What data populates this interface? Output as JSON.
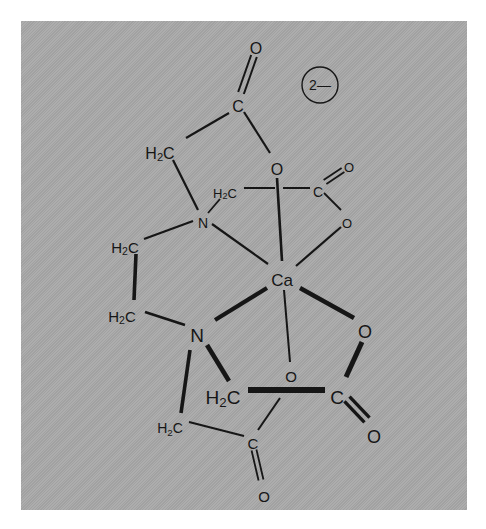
{
  "diagram": {
    "charge_badge": {
      "label": "2—",
      "cx": 320,
      "cy": 85,
      "r": 18
    },
    "colors": {
      "panel": "#a8a8a8",
      "ink": "#161616",
      "page": "#ffffff"
    },
    "atoms": [
      {
        "id": "o_top",
        "label": "O",
        "x": 256,
        "y": 48,
        "size": 16
      },
      {
        "id": "c_top",
        "label": "C",
        "x": 238,
        "y": 106,
        "size": 16
      },
      {
        "id": "ch2_a",
        "label": "H₂C",
        "x": 160,
        "y": 153,
        "size": 16
      },
      {
        "id": "o_a",
        "label": "O",
        "x": 277,
        "y": 169,
        "size": 16
      },
      {
        "id": "ch2_b",
        "label": "H₂C",
        "x": 225,
        "y": 193,
        "size": 13
      },
      {
        "id": "c_b",
        "label": "C",
        "x": 318,
        "y": 192,
        "size": 14
      },
      {
        "id": "o_b_dbl",
        "label": "O",
        "x": 349,
        "y": 167,
        "size": 13
      },
      {
        "id": "o_b",
        "label": "O",
        "x": 347,
        "y": 223,
        "size": 13
      },
      {
        "id": "n_top",
        "label": "N",
        "x": 203,
        "y": 223,
        "size": 14
      },
      {
        "id": "ch2_c",
        "label": "H₂C",
        "x": 125,
        "y": 247,
        "size": 15
      },
      {
        "id": "ca",
        "label": "Ca",
        "x": 282,
        "y": 280,
        "size": 17
      },
      {
        "id": "ch2_d",
        "label": "H₂C",
        "x": 122,
        "y": 316,
        "size": 15
      },
      {
        "id": "n_bot",
        "label": "N",
        "x": 197,
        "y": 335,
        "size": 19
      },
      {
        "id": "o_c",
        "label": "O",
        "x": 365,
        "y": 332,
        "size": 18
      },
      {
        "id": "o_d",
        "label": "O",
        "x": 291,
        "y": 376,
        "size": 15
      },
      {
        "id": "ch2_e",
        "label": "H₂C",
        "x": 223,
        "y": 397,
        "size": 19
      },
      {
        "id": "c_e",
        "label": "C",
        "x": 337,
        "y": 397,
        "size": 19
      },
      {
        "id": "ch2_f",
        "label": "H₂C",
        "x": 170,
        "y": 428,
        "size": 14
      },
      {
        "id": "o_e_dbl",
        "label": "O",
        "x": 374,
        "y": 437,
        "size": 18
      },
      {
        "id": "c_f",
        "label": "C",
        "x": 253,
        "y": 443,
        "size": 15
      },
      {
        "id": "o_f",
        "label": "O",
        "x": 264,
        "y": 496,
        "size": 15
      }
    ],
    "bonds": [
      {
        "x1": 186,
        "y1": 138,
        "x2": 229,
        "y2": 113,
        "w": 2.2
      },
      {
        "x1": 244,
        "y1": 112,
        "x2": 270,
        "y2": 153,
        "w": 2.2
      },
      {
        "x1": 173,
        "y1": 160,
        "x2": 198,
        "y2": 210,
        "w": 2.2
      },
      {
        "x1": 208,
        "y1": 213,
        "x2": 220,
        "y2": 199,
        "w": 1.8
      },
      {
        "x1": 244,
        "y1": 188,
        "x2": 275,
        "y2": 188,
        "w": 2
      },
      {
        "x1": 283,
        "y1": 188,
        "x2": 310,
        "y2": 188,
        "w": 2
      },
      {
        "x1": 324,
        "y1": 193,
        "x2": 341,
        "y2": 210,
        "w": 1.8
      },
      {
        "x1": 277,
        "y1": 178,
        "x2": 282,
        "y2": 261,
        "w": 2.6
      },
      {
        "x1": 341,
        "y1": 227,
        "x2": 296,
        "y2": 266,
        "w": 2.2
      },
      {
        "x1": 212,
        "y1": 224,
        "x2": 268,
        "y2": 264,
        "w": 2.2
      },
      {
        "x1": 144,
        "y1": 239,
        "x2": 193,
        "y2": 221,
        "w": 2.2
      },
      {
        "x1": 136,
        "y1": 254,
        "x2": 134,
        "y2": 300,
        "w": 3.6
      },
      {
        "x1": 145,
        "y1": 312,
        "x2": 185,
        "y2": 325,
        "w": 2.8
      },
      {
        "x1": 215,
        "y1": 320,
        "x2": 267,
        "y2": 288,
        "w": 4.2
      },
      {
        "x1": 300,
        "y1": 288,
        "x2": 354,
        "y2": 318,
        "w": 4.4
      },
      {
        "x1": 284,
        "y1": 290,
        "x2": 290,
        "y2": 362,
        "w": 2
      },
      {
        "x1": 207,
        "y1": 345,
        "x2": 229,
        "y2": 381,
        "w": 4.6
      },
      {
        "x1": 190,
        "y1": 350,
        "x2": 181,
        "y2": 413,
        "w": 3.6
      },
      {
        "x1": 248,
        "y1": 390,
        "x2": 325,
        "y2": 390,
        "w": 6
      },
      {
        "x1": 362,
        "y1": 342,
        "x2": 346,
        "y2": 377,
        "w": 5
      },
      {
        "x1": 189,
        "y1": 422,
        "x2": 244,
        "y2": 436,
        "w": 2
      },
      {
        "x1": 258,
        "y1": 430,
        "x2": 280,
        "y2": 398,
        "w": 2
      }
    ],
    "double_bonds": [
      {
        "x1": 241,
        "y1": 93,
        "x2": 254,
        "y2": 56,
        "w": 2,
        "gap": 3
      },
      {
        "x1": 325,
        "y1": 182,
        "x2": 343,
        "y2": 170,
        "w": 1.8,
        "gap": 2.5
      },
      {
        "x1": 347,
        "y1": 399,
        "x2": 367,
        "y2": 420,
        "w": 3.4,
        "gap": 3.5
      },
      {
        "x1": 254,
        "y1": 450,
        "x2": 261,
        "y2": 480,
        "w": 1.8,
        "gap": 2.5
      }
    ]
  }
}
